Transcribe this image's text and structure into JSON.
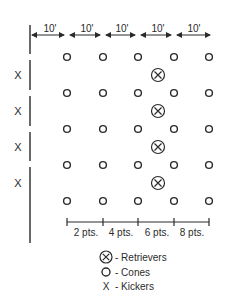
{
  "diagram": {
    "dimensions": [
      "10'",
      "10'",
      "10'",
      "10'",
      "10'"
    ],
    "kickers_label": [
      "X",
      "X",
      "X",
      "X"
    ],
    "points": [
      "2 pts.",
      "4 pts.",
      "6 pts.",
      "8 pts."
    ],
    "legend": {
      "retrievers": "- Retrievers",
      "cones": "- Cones",
      "kickers": "- Kickers",
      "kicker_symbol": "X"
    },
    "grid": {
      "columns": 5,
      "rows": 5,
      "retrievers": 4
    },
    "colors": {
      "ink": "#2a2a2a",
      "background": "#ffffff"
    }
  }
}
